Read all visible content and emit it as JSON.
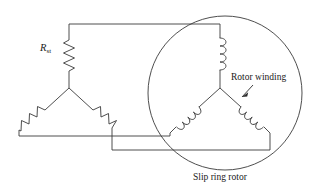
{
  "figure": {
    "width": 319,
    "height": 195,
    "background_color": "#ffffff",
    "line_color": "#3a3a3a",
    "text_color": "#1a1a1a"
  },
  "labels": {
    "starting_resistance": {
      "symbol": "R",
      "subscript": "st",
      "meaning": "starting resistance"
    },
    "rotor_winding": "Rotor winding",
    "slip_ring_rotor": "Slip ring rotor"
  },
  "diagram_data": {
    "type": "schematic",
    "components": [
      {
        "id": "rst-phase-a",
        "kind": "resistor",
        "group": "external-starting-resistance",
        "label": "R_st",
        "orientation": "vertical",
        "position": "upper",
        "connects": [
          "top-bus",
          "left-star-node"
        ]
      },
      {
        "id": "rst-phase-b",
        "kind": "resistor",
        "group": "external-starting-resistance",
        "orientation": "diagonal-down-left",
        "position": "lower-left",
        "connects": [
          "left-star-node",
          "lower-bus-1"
        ]
      },
      {
        "id": "rst-phase-c",
        "kind": "resistor",
        "group": "external-starting-resistance",
        "orientation": "diagonal-down-right",
        "position": "lower-right",
        "connects": [
          "left-star-node",
          "lower-bus-2"
        ]
      },
      {
        "id": "rotor-coil-a",
        "kind": "inductor",
        "group": "rotor-winding",
        "orientation": "vertical",
        "position": "upper",
        "connects": [
          "top-bus",
          "rotor-star-node"
        ]
      },
      {
        "id": "rotor-coil-b",
        "kind": "inductor",
        "group": "rotor-winding",
        "orientation": "diagonal-down-left",
        "position": "lower-left",
        "connects": [
          "rotor-star-node",
          "lower-bus-1"
        ]
      },
      {
        "id": "rotor-coil-c",
        "kind": "inductor",
        "group": "rotor-winding",
        "orientation": "diagonal-down-right",
        "position": "lower-right",
        "connects": [
          "rotor-star-node",
          "lower-bus-2"
        ]
      }
    ],
    "nodes": [
      {
        "id": "left-star-node",
        "label": "external resistance star point"
      },
      {
        "id": "rotor-star-node",
        "label": "rotor winding star point"
      }
    ],
    "connections": [
      {
        "id": "top-bus",
        "from": "rst-phase-a",
        "to": "rotor-coil-a"
      },
      {
        "id": "lower-bus-1",
        "from": "rst-phase-b",
        "to": "rotor-coil-b"
      },
      {
        "id": "lower-bus-2",
        "from": "rst-phase-c",
        "to": "rotor-coil-c"
      }
    ],
    "boundary": {
      "shape": "circle",
      "label": "Slip ring rotor",
      "encloses": "rotor-winding"
    },
    "annotations": [
      {
        "text": "Rotor winding",
        "points_to": "rotor-coil-c",
        "arrow": true
      }
    ]
  }
}
